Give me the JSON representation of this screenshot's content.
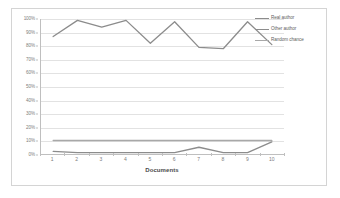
{
  "chart_data": {
    "type": "line",
    "title": "",
    "xlabel": "Documents",
    "ylabel": "",
    "categories": [
      "1",
      "2",
      "3",
      "4",
      "5",
      "6",
      "7",
      "8",
      "9",
      "10"
    ],
    "ylim": [
      0,
      100
    ],
    "ytick_labels": [
      "100%",
      "90%",
      "80%",
      "70%",
      "60%",
      "50%",
      "40%",
      "30%",
      "20%",
      "10%",
      "0%"
    ],
    "ytick_values": [
      100,
      90,
      80,
      70,
      60,
      50,
      40,
      30,
      20,
      10,
      0
    ],
    "grid": true,
    "legend_position": "top-right",
    "series": [
      {
        "name": "Real author",
        "color": "#8c8c8c",
        "values": [
          87,
          99,
          94,
          99,
          82,
          98,
          79,
          78,
          98,
          81
        ]
      },
      {
        "name": "Other author",
        "color": "#8c8c8c",
        "values": [
          2,
          1,
          1,
          1,
          1,
          1,
          5,
          1,
          1,
          9
        ]
      },
      {
        "name": "Random chance",
        "color": "#a8a8a8",
        "values": [
          10,
          10,
          10,
          10,
          10,
          10,
          10,
          10,
          10,
          10
        ]
      }
    ]
  },
  "legend": {
    "items": [
      {
        "label": "Real author"
      },
      {
        "label": "Other author"
      },
      {
        "label": "Random chance"
      }
    ]
  },
  "axes": {
    "x_title": "Documents"
  },
  "colors": {
    "frame_border": "#d4d4d4",
    "gridline": "#e2e2e2",
    "axis_line": "#bfbfbf",
    "tick_text": "#7d7d7d",
    "title_text": "#4a4a4a",
    "series_primary": "#8c8c8c",
    "series_secondary": "#8c8c8c",
    "series_baseline": "#a8a8a8",
    "background": "#ffffff"
  }
}
